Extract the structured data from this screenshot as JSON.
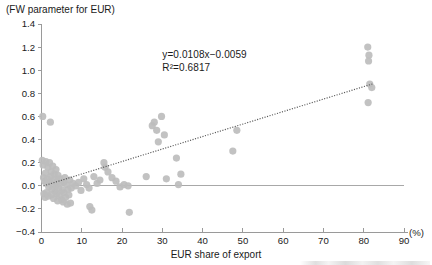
{
  "chart_data": {
    "type": "scatter",
    "title": "(FW parameter for EUR)",
    "xlabel": "EUR share of export",
    "ylabel": "",
    "xunit": "(%)",
    "xlim": [
      0,
      90
    ],
    "ylim": [
      -0.4,
      1.4
    ],
    "grid": false,
    "legend": null,
    "xticks": [
      0,
      10,
      20,
      30,
      40,
      50,
      60,
      70,
      80,
      90
    ],
    "xticklabels": [
      "0",
      "10",
      "20",
      "30",
      "40",
      "50",
      "60",
      "70",
      "80",
      "90"
    ],
    "yticks": [
      -0.4,
      -0.2,
      0.0,
      0.2,
      0.4,
      0.6,
      0.8,
      1.0,
      1.2,
      1.4
    ],
    "yticklabels": [
      "-0.4",
      "-0.2",
      "0.0",
      "0.2",
      "0.4",
      "0.6",
      "0.8",
      "1.0",
      "1.2",
      "1.4"
    ],
    "annotations": {
      "equation": "y=0.0108x−0.0059",
      "r_squared": "R²=0.6817",
      "equation_x": 30.0,
      "equation_y": 1.11
    },
    "trendline": {
      "type": "linear",
      "slope": 0.0108,
      "intercept": -0.0059,
      "style": "dotted",
      "x_start": 0.5,
      "x_end": 82.5
    },
    "reference_line": {
      "y": 0.0,
      "x_start": 7.5,
      "x_end": 90.0,
      "style": "solid"
    },
    "series": [
      {
        "name": "EUR share of export vs FW parameter",
        "marker": "circle",
        "color": "#bdbdbd",
        "points": [
          [
            0.3,
            0.6
          ],
          [
            2.2,
            0.55
          ],
          [
            0.2,
            0.22
          ],
          [
            0.4,
            0.18
          ],
          [
            1.1,
            0.21
          ],
          [
            1.6,
            0.16
          ],
          [
            2.0,
            0.2
          ],
          [
            2.4,
            0.12
          ],
          [
            2.8,
            0.17
          ],
          [
            3.2,
            0.1
          ],
          [
            3.6,
            0.14
          ],
          [
            4.1,
            0.09
          ],
          [
            0.5,
            0.07
          ],
          [
            0.8,
            0.04
          ],
          [
            1.0,
            0.11
          ],
          [
            1.3,
            0.02
          ],
          [
            1.5,
            0.06
          ],
          [
            1.8,
            -0.01
          ],
          [
            2.1,
            0.03
          ],
          [
            2.3,
            0.08
          ],
          [
            2.6,
            -0.03
          ],
          [
            2.9,
            0.01
          ],
          [
            3.1,
            0.05
          ],
          [
            3.4,
            -0.05
          ],
          [
            3.7,
            0.0
          ],
          [
            3.9,
            0.04
          ],
          [
            4.3,
            -0.02
          ],
          [
            4.6,
            0.06
          ],
          [
            4.9,
            0.02
          ],
          [
            5.2,
            -0.04
          ],
          [
            5.5,
            0.03
          ],
          [
            5.8,
            0.07
          ],
          [
            0.6,
            -0.07
          ],
          [
            0.9,
            -0.1
          ],
          [
            1.2,
            -0.06
          ],
          [
            1.7,
            -0.09
          ],
          [
            2.5,
            -0.08
          ],
          [
            3.0,
            -0.11
          ],
          [
            3.8,
            -0.07
          ],
          [
            4.5,
            -0.09
          ],
          [
            5.0,
            -0.12
          ],
          [
            5.6,
            -0.06
          ],
          [
            6.2,
            0.01
          ],
          [
            6.6,
            -0.03
          ],
          [
            7.0,
            0.05
          ],
          [
            7.4,
            -0.02
          ],
          [
            7.8,
            0.02
          ],
          [
            6.0,
            -0.1
          ],
          [
            6.8,
            -0.08
          ],
          [
            5.4,
            -0.14
          ],
          [
            4.0,
            -0.13
          ],
          [
            6.4,
            -0.16
          ],
          [
            7.2,
            -0.15
          ],
          [
            8.5,
            0.0
          ],
          [
            9.2,
            0.03
          ],
          [
            9.8,
            -0.04
          ],
          [
            10.5,
            0.06
          ],
          [
            11.2,
            0.01
          ],
          [
            11.8,
            -0.02
          ],
          [
            12.0,
            -0.18
          ],
          [
            13.0,
            0.08
          ],
          [
            13.8,
            0.02
          ],
          [
            14.5,
            0.05
          ],
          [
            12.5,
            -0.21
          ],
          [
            15.5,
            0.2
          ],
          [
            15.8,
            0.16
          ],
          [
            16.5,
            0.12
          ],
          [
            17.5,
            0.07
          ],
          [
            18.5,
            0.04
          ],
          [
            19.5,
            -0.01
          ],
          [
            20.5,
            0.01
          ],
          [
            21.5,
            0.0
          ],
          [
            21.8,
            -0.23
          ],
          [
            26.0,
            0.08
          ],
          [
            27.5,
            0.52
          ],
          [
            28.0,
            0.55
          ],
          [
            28.6,
            0.48
          ],
          [
            29.8,
            0.6
          ],
          [
            30.5,
            0.44
          ],
          [
            29.0,
            0.38
          ],
          [
            31.0,
            0.06
          ],
          [
            33.5,
            0.24
          ],
          [
            34.0,
            0.01
          ],
          [
            34.6,
            0.1
          ],
          [
            47.5,
            0.3
          ],
          [
            48.5,
            0.48
          ],
          [
            81.0,
            1.2
          ],
          [
            81.3,
            1.13
          ],
          [
            81.2,
            1.08
          ],
          [
            81.5,
            0.88
          ],
          [
            82.0,
            0.85
          ],
          [
            81.1,
            0.72
          ]
        ]
      }
    ]
  }
}
